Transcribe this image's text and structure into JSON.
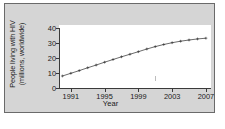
{
  "figure": {
    "background_color": "#d5d5d5",
    "border_color": "#6a6a6a",
    "plot_background": "#ffffff"
  },
  "chart_data": {
    "type": "line",
    "title": "",
    "xlabel": "Year",
    "ylabel": "People living with HIV\n(millions, worldwide)",
    "ylabel_line1": "People living with HIV",
    "ylabel_line2": "(millions, worldwide)",
    "xlim": [
      1989.6,
      2007.6
    ],
    "ylim": [
      0,
      42
    ],
    "xticks": [
      1991,
      1995,
      1999,
      2003,
      2007
    ],
    "xtick_labels": [
      "1991",
      "1995",
      "1999",
      "2003",
      "2007"
    ],
    "yticks": [
      0,
      10,
      20,
      30,
      40
    ],
    "ytick_labels": [
      "0",
      "10",
      "20",
      "30",
      "40"
    ],
    "grid": false,
    "legend": false,
    "line_color": "#2b2b2b",
    "marker": "plus",
    "x": [
      1990,
      1991,
      1992,
      1993,
      1994,
      1995,
      1996,
      1997,
      1998,
      1999,
      2000,
      2001,
      2002,
      2003,
      2004,
      2005,
      2006,
      2007
    ],
    "values": [
      8.0,
      9.8,
      11.6,
      13.5,
      15.3,
      17.2,
      19.0,
      20.8,
      22.5,
      24.2,
      26.0,
      27.6,
      29.0,
      30.2,
      31.2,
      32.0,
      32.7,
      33.2
    ],
    "series": [
      {
        "name": "People living with HIV (millions, worldwide)",
        "values": [
          8.0,
          9.8,
          11.6,
          13.5,
          15.3,
          17.2,
          19.0,
          20.8,
          22.5,
          24.2,
          26.0,
          27.6,
          29.0,
          30.2,
          31.2,
          32.0,
          32.7,
          33.2
        ]
      }
    ],
    "annotations": []
  }
}
